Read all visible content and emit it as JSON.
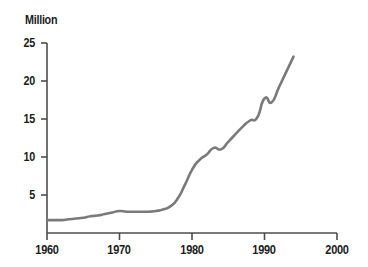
{
  "chart_data": {
    "type": "line",
    "title": "",
    "ylabel": "Million",
    "xlabel": "",
    "xlim": [
      1960,
      2000
    ],
    "ylim": [
      0,
      25
    ],
    "grid": false,
    "legend": null,
    "line_color": "#7a7a7a",
    "axis_color": "#4d4d4d",
    "text_color": "#1b1b1b",
    "yticks": [
      25,
      20,
      15,
      10,
      5
    ],
    "ytick_labels": [
      "25",
      "20",
      "15",
      "10",
      "5"
    ],
    "xticks": [
      1960,
      1970,
      1980,
      1990,
      2000
    ],
    "xtick_labels": [
      "1960",
      "1970",
      "1980",
      "1990",
      "2000"
    ],
    "x": [
      1960,
      1961,
      1962,
      1963,
      1964,
      1965,
      1966,
      1967,
      1968,
      1969,
      1970,
      1971,
      1972,
      1973,
      1974,
      1975,
      1976,
      1977,
      1978,
      1979,
      1980,
      1981,
      1982,
      1983,
      1984,
      1985,
      1986,
      1987,
      1988,
      1989,
      1990,
      1991,
      1992,
      1993,
      1994
    ],
    "values": [
      1.7,
      1.7,
      1.7,
      1.8,
      1.9,
      2.0,
      2.2,
      2.3,
      2.5,
      2.7,
      2.9,
      2.8,
      2.8,
      2.8,
      2.8,
      2.9,
      3.1,
      3.5,
      4.5,
      6.3,
      8.3,
      9.6,
      10.3,
      11.2,
      11.0,
      12.0,
      13.0,
      14.0,
      14.8,
      15.2,
      17.7,
      17.2,
      19.2,
      21.2,
      23.2
    ],
    "series": [
      {
        "name": "value",
        "values": [
          1.7,
          1.7,
          1.7,
          1.8,
          1.9,
          2.0,
          2.2,
          2.3,
          2.5,
          2.7,
          2.9,
          2.8,
          2.8,
          2.8,
          2.8,
          2.9,
          3.1,
          3.5,
          4.5,
          6.3,
          8.3,
          9.6,
          10.3,
          11.2,
          11.0,
          12.0,
          13.0,
          14.0,
          14.8,
          15.2,
          17.7,
          17.2,
          19.2,
          21.2,
          23.2
        ]
      }
    ]
  },
  "labels": {
    "unit_title": "Million",
    "y_0": "25",
    "y_1": "20",
    "y_2": "15",
    "y_3": "10",
    "y_4": "5",
    "x_0": "1960",
    "x_1": "1970",
    "x_2": "1980",
    "x_3": "1990",
    "x_4": "2000"
  }
}
